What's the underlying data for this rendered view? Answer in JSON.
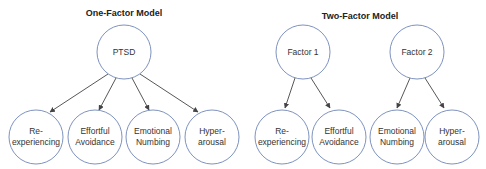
{
  "diagram": {
    "colors": {
      "node_stroke": "#6f86b8",
      "edge": "#444444",
      "text": "#333333",
      "background": "#ffffff"
    },
    "one_factor": {
      "title": "One-Factor Model",
      "root": {
        "label": "PTSD"
      },
      "children": [
        {
          "line1": "Re-",
          "line2": "experiencing"
        },
        {
          "line1": "Effortful",
          "line2": "Avoidance"
        },
        {
          "line1": "Emotional",
          "line2": "Numbing"
        },
        {
          "line1": "Hyper-",
          "line2": "arousal"
        }
      ]
    },
    "two_factor": {
      "title": "Two-Factor Model",
      "factors": [
        {
          "label": "Factor 1",
          "children": [
            {
              "line1": "Re-",
              "line2": "experiencing"
            },
            {
              "line1": "Effortful",
              "line2": "Avoidance"
            }
          ]
        },
        {
          "label": "Factor 2",
          "children": [
            {
              "line1": "Emotional",
              "line2": "Numbing"
            },
            {
              "line1": "Hyper-",
              "line2": "arousal"
            }
          ]
        }
      ]
    }
  }
}
